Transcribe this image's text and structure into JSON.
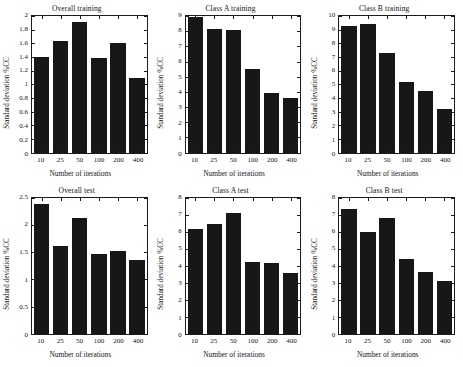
{
  "chart_data": [
    {
      "type": "bar",
      "title": "Overall training",
      "xlabel": "Number of iterations",
      "ylabel": "Standard deviation %CC",
      "categories": [
        "10",
        "25",
        "50",
        "100",
        "200",
        "400"
      ],
      "values": [
        1.4,
        1.64,
        1.91,
        1.39,
        1.61,
        1.09
      ],
      "ylim": [
        0,
        2
      ],
      "ytick_values": [
        0,
        0.2,
        0.4,
        0.6,
        0.8,
        1,
        1.2,
        1.4,
        1.6,
        1.8,
        2
      ],
      "ytick_labels": [
        "0",
        "0.2",
        "0.4",
        "0.6",
        "0.8",
        "1",
        "1.2",
        "1.4",
        "1.6",
        "1.8",
        "2"
      ],
      "grid": false,
      "legend": "none",
      "bar_color": "#171717"
    },
    {
      "type": "bar",
      "title": "Class A training",
      "xlabel": "Number of iterations",
      "ylabel": "Standard deviation %CC",
      "categories": [
        "10",
        "25",
        "50",
        "100",
        "200",
        "400"
      ],
      "values": [
        8.95,
        8.15,
        8.1,
        5.5,
        3.95,
        3.6
      ],
      "ylim": [
        0,
        9
      ],
      "ytick_values": [
        0,
        1,
        2,
        3,
        4,
        5,
        6,
        7,
        8,
        9
      ],
      "ytick_labels": [
        "0",
        "1",
        "2",
        "3",
        "4",
        "5",
        "6",
        "7",
        "8",
        "9"
      ],
      "grid": false,
      "legend": "none",
      "bar_color": "#171717"
    },
    {
      "type": "bar",
      "title": "Class B training",
      "xlabel": "Number of iterations",
      "ylabel": "Standard deviation %CC",
      "categories": [
        "10",
        "25",
        "50",
        "100",
        "200",
        "400"
      ],
      "values": [
        9.25,
        9.45,
        7.3,
        5.2,
        4.5,
        3.2
      ],
      "ylim": [
        0,
        10
      ],
      "ytick_values": [
        0,
        1,
        2,
        3,
        4,
        5,
        6,
        7,
        8,
        9,
        10
      ],
      "ytick_labels": [
        "0",
        "1",
        "2",
        "3",
        "4",
        "5",
        "6",
        "7",
        "8",
        "9",
        "10"
      ],
      "grid": false,
      "legend": "none",
      "bar_color": "#171717"
    },
    {
      "type": "bar",
      "title": "Overall test",
      "xlabel": "Number of iterations",
      "ylabel": "Standard deviation %CC",
      "categories": [
        "10",
        "25",
        "50",
        "100",
        "200",
        "400"
      ],
      "values": [
        2.38,
        1.62,
        2.12,
        1.47,
        1.52,
        1.36
      ],
      "ylim": [
        0,
        2.5
      ],
      "ytick_values": [
        0,
        0.5,
        1,
        1.5,
        2,
        2.5
      ],
      "ytick_labels": [
        "0",
        "0.5",
        "1",
        "1.5",
        "2",
        "2.5"
      ],
      "grid": false,
      "legend": "none",
      "bar_color": "#171717"
    },
    {
      "type": "bar",
      "title": "Class A test",
      "xlabel": "Number of iterations",
      "ylabel": "Standard deviation %CC",
      "categories": [
        "10",
        "25",
        "50",
        "100",
        "200",
        "400"
      ],
      "values": [
        6.13,
        6.42,
        7.07,
        4.22,
        4.15,
        3.58
      ],
      "ylim": [
        0,
        8
      ],
      "ytick_values": [
        0,
        1,
        2,
        3,
        4,
        5,
        6,
        7,
        8
      ],
      "ytick_labels": [
        "0",
        "1",
        "2",
        "3",
        "4",
        "5",
        "6",
        "7",
        "8"
      ],
      "grid": false,
      "legend": "none",
      "bar_color": "#171717"
    },
    {
      "type": "bar",
      "title": "Class B test",
      "xlabel": "Number of iterations",
      "ylabel": "Standard deviation %CC",
      "categories": [
        "10",
        "25",
        "50",
        "100",
        "200",
        "400"
      ],
      "values": [
        7.3,
        6.0,
        6.78,
        4.4,
        3.62,
        3.08
      ],
      "ylim": [
        0,
        8
      ],
      "ytick_values": [
        0,
        1,
        2,
        3,
        4,
        5,
        6,
        7,
        8
      ],
      "ytick_labels": [
        "0",
        "1",
        "2",
        "3",
        "4",
        "5",
        "6",
        "7",
        "8"
      ],
      "grid": false,
      "legend": "none",
      "bar_color": "#171717"
    }
  ]
}
